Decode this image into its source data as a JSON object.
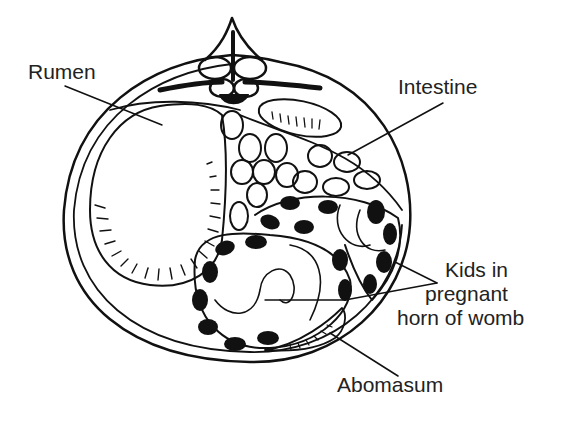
{
  "diagram": {
    "line_color": "#111111",
    "background": "#ffffff",
    "labels": {
      "rumen": "Rumen",
      "intestine": "Intestine",
      "kids_line1": "Kids in",
      "kids_line2": "pregnant",
      "kids_line3": "horn of womb",
      "abomasum": "Abomasum"
    }
  }
}
